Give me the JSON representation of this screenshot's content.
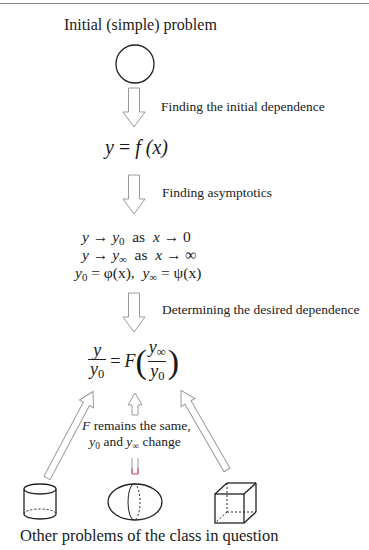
{
  "diagram": {
    "title_top": "Initial (simple) problem",
    "steps": [
      {
        "label": "Finding the initial dependence"
      },
      {
        "label": "Finding asymptotics"
      },
      {
        "label": "Determining the desired dependence"
      }
    ],
    "equation_1": {
      "lhs": "y",
      "eq": "=",
      "f": "f",
      "arg": "(x)"
    },
    "asymptotics": {
      "line1": {
        "y": "y",
        "arrow": "→",
        "y0": "y",
        "sub0": "0",
        "as": "as",
        "x": "x",
        "arrow2": "→",
        "limit": "0"
      },
      "line2": {
        "y": "y",
        "arrow": "→",
        "yinf": "y",
        "subinf": "∞",
        "as": "as",
        "x": "x",
        "arrow2": "→",
        "limit": "∞"
      },
      "line3": {
        "y0": "y",
        "sub0": "0",
        "eq": "=",
        "phi": "φ(x),",
        "yinf": "y",
        "subinf": "∞",
        "eq2": "=",
        "psi": "ψ(x)"
      }
    },
    "final_equation": {
      "num": "y",
      "den": "y",
      "den_sub": "0",
      "eq": "=",
      "F": "F",
      "inner_num": "y",
      "inner_num_sub": "∞",
      "inner_den": "y",
      "inner_den_sub": "0",
      "lparen": "(",
      "rparen": ")"
    },
    "note": {
      "line1_F": "F",
      "line1_rest": " remains the same,",
      "line2_y0": "y",
      "line2_sub0": "0",
      "line2_and": " and ",
      "line2_yinf": "y",
      "line2_subinf": "∞",
      "line2_rest": " change"
    },
    "shapes": [
      "circle",
      "cylinder",
      "ellipsoid",
      "cube"
    ],
    "title_bottom": "Other problems of the class in question",
    "colors": {
      "stroke": "#222222",
      "arrow_stroke": "#9a9a9a",
      "accent_red": "#d04060",
      "top_rule": "#8a8a8a"
    }
  }
}
